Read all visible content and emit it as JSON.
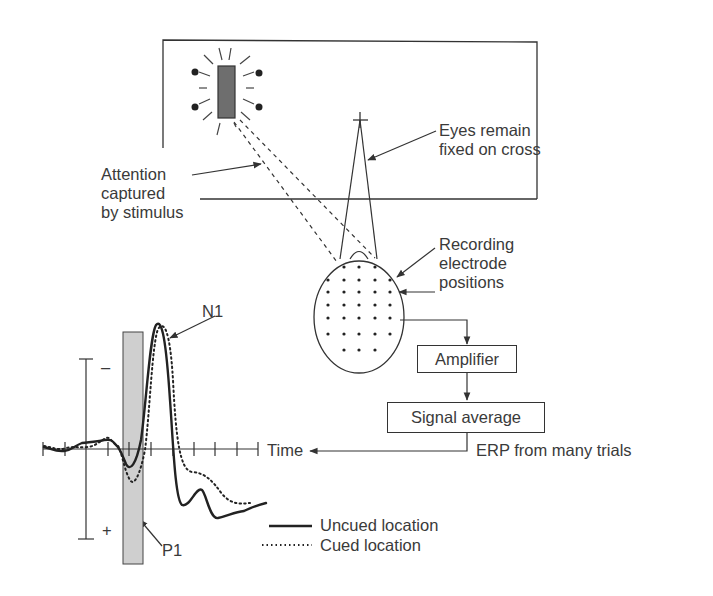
{
  "diagram": {
    "title": "",
    "labels": {
      "attention": [
        "Attention",
        "captured",
        "by stimulus"
      ],
      "eyes": [
        "Eyes remain",
        "fixed on cross"
      ],
      "electrodes": [
        "Recording",
        "electrode",
        "positions"
      ],
      "amplifier": "Amplifier",
      "signal_average": "Signal average",
      "erp": "ERP from many trials",
      "time_axis": "Time",
      "n1": "N1",
      "p1": "P1",
      "minus": "–",
      "plus": "+"
    },
    "legend": [
      {
        "style": "solid",
        "label": "Uncued location"
      },
      {
        "style": "dotted",
        "label": "Cued location"
      }
    ],
    "colors": {
      "line": "#333333",
      "stimulus_fill": "#6e6e6e",
      "p1_band_fill": "#cfcfcf",
      "text": "#3a3a3a"
    },
    "flow": [
      "Recording electrode positions",
      "Amplifier",
      "Signal average",
      "ERP from many trials"
    ]
  }
}
